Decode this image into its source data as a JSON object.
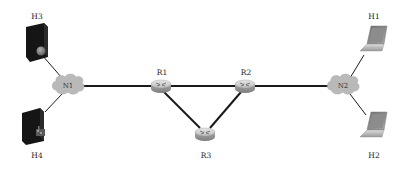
{
  "diagram": {
    "type": "network-topology",
    "background": "#ffffff",
    "colors": {
      "link": "#1a1a1a",
      "cloud": "#b9b9b9",
      "router_top": "#d4d4d4",
      "router_side": "#9c9c9c",
      "server": "#151515",
      "laptop": "#8a8a8a"
    },
    "nodes": [
      {
        "id": "H3",
        "label": "H3",
        "kind": "server",
        "icon": "server-icon"
      },
      {
        "id": "H4",
        "label": "H4",
        "kind": "server",
        "icon": "server-icon"
      },
      {
        "id": "N1",
        "label": "N1",
        "kind": "network-cloud",
        "icon": "cloud-icon"
      },
      {
        "id": "R1",
        "label": "R1",
        "kind": "router",
        "icon": "router-icon"
      },
      {
        "id": "R2",
        "label": "R2",
        "kind": "router",
        "icon": "router-icon"
      },
      {
        "id": "R3",
        "label": "R3",
        "kind": "router",
        "icon": "router-icon"
      },
      {
        "id": "N2",
        "label": "N2",
        "kind": "network-cloud",
        "icon": "cloud-icon"
      },
      {
        "id": "H1",
        "label": "H1",
        "kind": "laptop",
        "icon": "laptop-icon"
      },
      {
        "id": "H2",
        "label": "H2",
        "kind": "laptop",
        "icon": "laptop-icon"
      }
    ],
    "edges": [
      {
        "from": "H3",
        "to": "N1",
        "style": "thin"
      },
      {
        "from": "H4",
        "to": "N1",
        "style": "thin"
      },
      {
        "from": "N1",
        "to": "R1",
        "style": "thick"
      },
      {
        "from": "R1",
        "to": "R2",
        "style": "thick"
      },
      {
        "from": "R1",
        "to": "R3",
        "style": "thick"
      },
      {
        "from": "R2",
        "to": "R3",
        "style": "thick"
      },
      {
        "from": "R2",
        "to": "N2",
        "style": "thick"
      },
      {
        "from": "N2",
        "to": "H1",
        "style": "thin"
      },
      {
        "from": "N2",
        "to": "H2",
        "style": "thin"
      }
    ]
  }
}
